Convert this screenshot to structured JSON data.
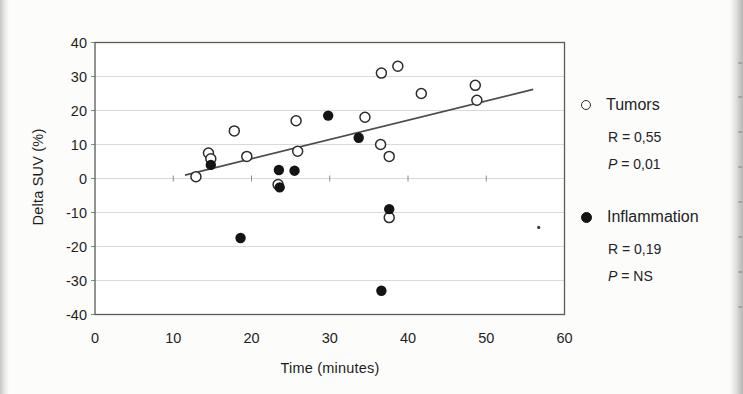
{
  "page": {
    "background": "#fcfcfb"
  },
  "colors": {
    "frame": "#5a5a5a",
    "grid": "#d9d9d7",
    "tick": "#8a8a88",
    "trendline": "#4c4c4c",
    "open_marker_stroke": "#2b2b2b",
    "filled_marker": "#141414",
    "text": "#1f1f1f"
  },
  "chart_data": {
    "type": "scatter",
    "title": "",
    "xlabel": "Time (minutes)",
    "ylabel": "Delta SUV (%)",
    "xlim": [
      0,
      60
    ],
    "ylim": [
      -40,
      40
    ],
    "x_ticks": [
      0,
      10,
      20,
      30,
      40,
      50,
      60
    ],
    "y_ticks": [
      40,
      30,
      20,
      10,
      0,
      -10,
      -20,
      -30,
      -40
    ],
    "grid": "horizontal-light",
    "legend_position": "right",
    "series": [
      {
        "name": "Tumors",
        "marker": "open-circle",
        "r_label": "R = 0,55",
        "p_label_italic": "P",
        "p_label_rest": " = 0,01",
        "points": [
          [
            12.9,
            0.5
          ],
          [
            14.5,
            7.5
          ],
          [
            14.8,
            5.8
          ],
          [
            17.8,
            14
          ],
          [
            19.4,
            6.5
          ],
          [
            23.4,
            -1.8
          ],
          [
            25.7,
            17
          ],
          [
            25.9,
            8
          ],
          [
            34.5,
            18
          ],
          [
            36.5,
            10
          ],
          [
            37.6,
            6.5
          ],
          [
            36.6,
            31
          ],
          [
            38.7,
            33
          ],
          [
            41.7,
            25
          ],
          [
            48.6,
            27.4
          ],
          [
            48.8,
            23
          ],
          [
            37.6,
            -11.5
          ]
        ]
      },
      {
        "name": "Inflammation",
        "marker": "filled-circle",
        "r_label": "R = 0,19",
        "p_label_italic": "P",
        "p_label_rest": " = NS",
        "points": [
          [
            14.8,
            4
          ],
          [
            18.6,
            -17.5
          ],
          [
            23.5,
            2.5
          ],
          [
            25.5,
            2.3
          ],
          [
            23.6,
            -2.6
          ],
          [
            29.8,
            18.5
          ],
          [
            33.7,
            12
          ],
          [
            37.6,
            -9
          ],
          [
            36.6,
            -33
          ]
        ]
      }
    ],
    "trendline": {
      "x1": 11.5,
      "y1": 1,
      "x2": 56,
      "y2": 26.2
    },
    "artifact_speck": [
      56.7,
      -14.4
    ]
  },
  "scan": {
    "edge_marks_y": [
      62,
      96,
      131,
      166,
      201,
      236,
      271,
      306
    ]
  }
}
